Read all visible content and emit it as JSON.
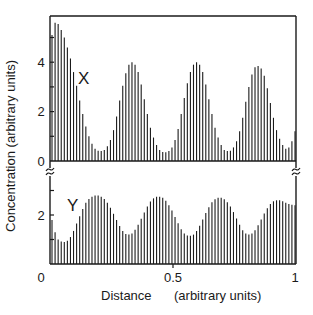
{
  "chart_data": {
    "type": "bar",
    "title": "",
    "xlabel": "Distance",
    "xlabel_units": "(arbitrary units)",
    "ylabel": "Concentration  (arbitrary units)",
    "xlim": [
      0,
      1
    ],
    "x_ticks": [
      {
        "value": 0,
        "label": "0"
      },
      {
        "value": 0.5,
        "label": "0.5"
      },
      {
        "value": 1,
        "label": "1"
      }
    ],
    "grid": false,
    "legend": "none (series labeled inline)",
    "panels": [
      {
        "name": "X",
        "label": "X",
        "ylim": [
          0,
          6
        ],
        "y_ticks": [
          {
            "value": 0,
            "label": "0"
          },
          {
            "value": 1,
            "label": ""
          },
          {
            "value": 2,
            "label": "2"
          },
          {
            "value": 3,
            "label": ""
          },
          {
            "value": 4,
            "label": "4"
          },
          {
            "value": 5,
            "label": ""
          }
        ],
        "values": [
          5.1,
          5.6,
          5.55,
          5.3,
          5.0,
          4.6,
          4.15,
          3.6,
          3.05,
          2.45,
          1.9,
          1.4,
          1.0,
          0.7,
          0.5,
          0.42,
          0.4,
          0.45,
          0.6,
          0.85,
          1.25,
          1.8,
          2.45,
          3.05,
          3.55,
          3.9,
          4.0,
          3.9,
          3.6,
          3.1,
          2.5,
          1.9,
          1.35,
          0.95,
          0.65,
          0.45,
          0.36,
          0.35,
          0.4,
          0.55,
          0.85,
          1.3,
          1.9,
          2.55,
          3.15,
          3.6,
          3.9,
          4.0,
          3.9,
          3.6,
          3.1,
          2.5,
          1.9,
          1.35,
          0.95,
          0.65,
          0.45,
          0.4,
          0.42,
          0.55,
          0.8,
          1.2,
          1.75,
          2.4,
          3.0,
          3.5,
          3.8,
          3.85,
          3.75,
          3.45,
          2.95,
          2.35,
          1.75,
          1.25,
          0.9,
          0.65,
          0.5,
          0.55,
          0.8,
          1.2
        ]
      },
      {
        "name": "Y",
        "label": "Y",
        "ylim": [
          0,
          3.3
        ],
        "y_ticks": [
          {
            "value": 0,
            "label": "0"
          },
          {
            "value": 1,
            "label": ""
          },
          {
            "value": 2,
            "label": "2"
          },
          {
            "value": 3,
            "label": ""
          }
        ],
        "values": [
          1.8,
          1.3,
          1.0,
          0.92,
          0.9,
          0.95,
          1.1,
          1.35,
          1.65,
          1.95,
          2.25,
          2.5,
          2.65,
          2.75,
          2.8,
          2.8,
          2.75,
          2.65,
          2.5,
          2.3,
          2.05,
          1.8,
          1.55,
          1.35,
          1.22,
          1.2,
          1.25,
          1.4,
          1.6,
          1.85,
          2.1,
          2.35,
          2.55,
          2.68,
          2.75,
          2.75,
          2.7,
          2.58,
          2.4,
          2.18,
          1.92,
          1.66,
          1.42,
          1.25,
          1.16,
          1.15,
          1.2,
          1.35,
          1.56,
          1.82,
          2.08,
          2.32,
          2.52,
          2.64,
          2.7,
          2.7,
          2.64,
          2.52,
          2.35,
          2.12,
          1.86,
          1.6,
          1.38,
          1.24,
          1.2,
          1.25,
          1.38,
          1.58,
          1.82,
          2.06,
          2.28,
          2.45,
          2.56,
          2.6,
          2.6,
          2.56,
          2.5,
          2.45,
          2.42,
          2.4
        ]
      }
    ],
    "axis_break": "between panels on left and right axes (≈ symbol)",
    "annotations": [
      "X",
      "Y"
    ]
  }
}
